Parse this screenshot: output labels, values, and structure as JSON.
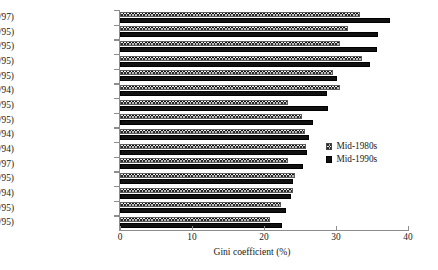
{
  "chart_data": {
    "type": "bar",
    "orientation": "horizontal",
    "title": "",
    "xlabel": "Gini coefficient (%)",
    "ylabel": "",
    "xlim": [
      0,
      40
    ],
    "xticks": [
      0,
      10,
      20,
      30,
      40
    ],
    "xtick_labels": [
      "0",
      "10",
      "20",
      "30",
      "40"
    ],
    "grid": false,
    "legend_position": "middle-right",
    "categories": [
      "US (86/97)",
      "UK (86/95)",
      "Italy (86/95)",
      "Ireland (87/95)",
      "Canada (87/95)",
      "France (84/94)",
      "Austria (87/95)",
      "Denmark (87/95)",
      "Germany (84/94)",
      "Netherlands (87/94)",
      "Belgium (85/97)",
      "Norway (86/95)",
      "Luxembourg (85/94)",
      "Sweden (87/95)",
      "Finland (87/95)"
    ],
    "series": [
      {
        "name": "Mid-1980s",
        "fill": "checkered",
        "values": [
          33.3,
          31.7,
          30.6,
          33.6,
          29.6,
          30.5,
          23.3,
          25.3,
          25.7,
          25.8,
          23.3,
          24.3,
          24.0,
          22.4,
          20.8
        ]
      },
      {
        "name": "Mid-1990s",
        "fill": "solid-black",
        "values": [
          37.5,
          35.8,
          35.7,
          34.7,
          30.1,
          28.8,
          28.9,
          26.8,
          26.2,
          26.0,
          25.4,
          24.0,
          23.8,
          23.1,
          22.5
        ]
      }
    ]
  },
  "legend": {
    "items": [
      {
        "label": "Mid-1980s"
      },
      {
        "label": "Mid-1990s"
      }
    ]
  },
  "colors": {
    "axis": "#8d8d8d",
    "text": "#1a1a1a",
    "series_1980s": "#2b2b2b",
    "series_1990s": "#111111",
    "background": "#ffffff"
  }
}
